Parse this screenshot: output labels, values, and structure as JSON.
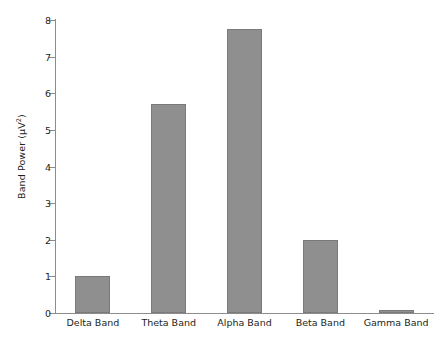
{
  "chart_data": {
    "type": "bar",
    "title": "",
    "xlabel": "",
    "ylabel": "Band Power (μV²)",
    "ylabel_base": "Band Power (μV",
    "ylabel_sup": "2",
    "ylabel_tail": ")",
    "categories": [
      "Delta Band",
      "Theta Band",
      "Alpha Band",
      "Beta Band",
      "Gamma Band"
    ],
    "values": [
      1.0,
      5.7,
      7.75,
      2.0,
      0.08
    ],
    "ylim": [
      0,
      8
    ],
    "yticks": [
      0,
      1,
      2,
      3,
      4,
      5,
      6,
      7,
      8
    ],
    "ytick_labels": [
      "0",
      "1",
      "2",
      "3",
      "4",
      "5",
      "6",
      "7",
      "8"
    ],
    "grid": false,
    "legend": "none",
    "bar_color": "#8f8f8f",
    "bar_edge_color": "#7a7a7a",
    "axis_color": "#8c8c8c",
    "text_color": "#231f20",
    "background_color": "#ffffff"
  }
}
